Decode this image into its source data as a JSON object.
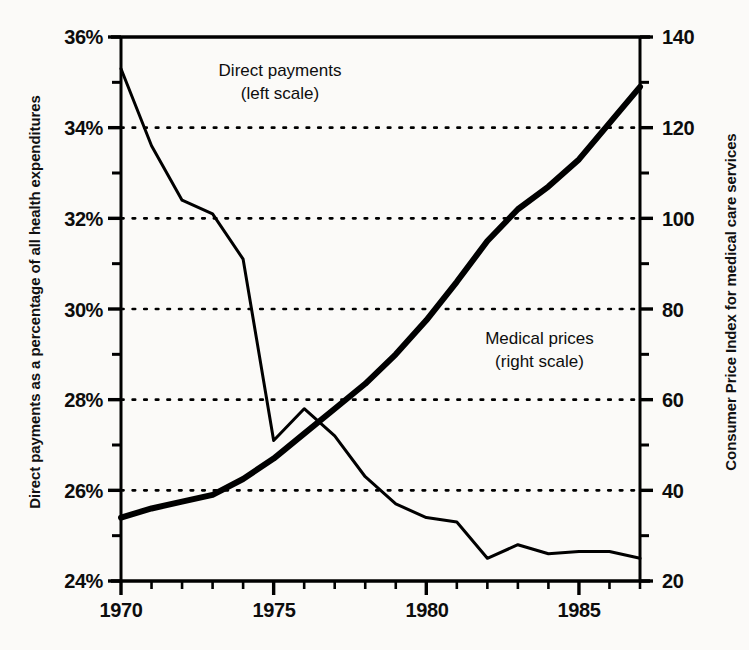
{
  "chart_data": {
    "type": "line",
    "title": "",
    "xlabel": "",
    "x_tick_labels": [
      "1970",
      "1975",
      "1980",
      "1985"
    ],
    "x_tick_values": [
      1970,
      1975,
      1980,
      1985
    ],
    "xlim": [
      1970,
      1987
    ],
    "grid": "horizontal-dotted",
    "legend_position": "inline-annotations",
    "axes": [
      {
        "id": "left",
        "label": "Direct payments as a percentage of all health expenditures",
        "tick_labels": [
          "36%",
          "34%",
          "32%",
          "30%",
          "28%",
          "26%",
          "24%"
        ],
        "tick_values": [
          36,
          34,
          32,
          30,
          28,
          26,
          24
        ],
        "ylim": [
          24,
          36
        ],
        "minor_tick_step": 1
      },
      {
        "id": "right",
        "label": "Consumer Price Index for medical care services",
        "tick_labels": [
          "140",
          "120",
          "100",
          "80",
          "60",
          "40",
          "20"
        ],
        "tick_values": [
          140,
          120,
          100,
          80,
          60,
          40,
          20
        ],
        "ylim": [
          20,
          140
        ],
        "minor_tick_step": 10
      }
    ],
    "x": [
      1970,
      1971,
      1972,
      1973,
      1974,
      1975,
      1976,
      1977,
      1978,
      1979,
      1980,
      1981,
      1982,
      1983,
      1984,
      1985,
      1986,
      1987
    ],
    "series": [
      {
        "name": "Direct payments",
        "axis": "left",
        "annotation": "Direct payments\n(left scale)",
        "annotation_line1": "Direct payments",
        "annotation_line2": "(left scale)",
        "units": "percent",
        "color": "#000000",
        "line_width": 3,
        "values": [
          35.3,
          33.6,
          32.4,
          32.1,
          31.1,
          27.1,
          27.8,
          27.2,
          26.3,
          25.7,
          25.4,
          25.3,
          24.5,
          24.8,
          24.6,
          24.65,
          24.65,
          24.5
        ]
      },
      {
        "name": "Medical prices",
        "axis": "right",
        "annotation": "Medical prices\n(right scale)",
        "annotation_line1": "Medical prices",
        "annotation_line2": "(right scale)",
        "units": "index",
        "color": "#000000",
        "line_width": 6,
        "values": [
          34,
          36,
          37.5,
          39,
          42.5,
          47,
          52.5,
          58,
          63.5,
          70,
          77.5,
          86,
          95,
          102,
          107,
          113,
          121,
          129
        ]
      }
    ]
  }
}
